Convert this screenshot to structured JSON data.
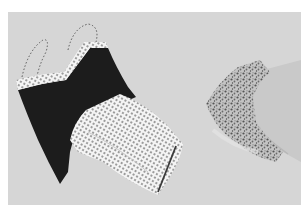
{
  "image": {
    "description": "Grayscale product photo of folded sleepwear on a light gray background",
    "colors": {
      "border": "#ffffff",
      "background": "#d6d6d6",
      "black_top": "#1c1c1c",
      "dot_fabric": "#f4f4f4",
      "dots": "#2a2a2a",
      "floral_fabric": "#bdbdbd",
      "floral_pattern": "#555555",
      "pale_garment": "#c9c9c9",
      "piping": "#3a3a3a"
    },
    "items": [
      {
        "name": "black camisole",
        "pattern": "solid",
        "detail": "polka-dot trim and straps"
      },
      {
        "name": "polka-dot shorts",
        "pattern": "polka-dot",
        "detail": "dark piping along hem"
      },
      {
        "name": "floral top",
        "pattern": "floral print"
      },
      {
        "name": "pale garment",
        "pattern": "solid"
      }
    ]
  }
}
